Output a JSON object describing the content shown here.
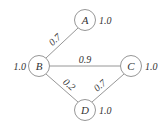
{
  "diagram": {
    "type": "weighted-graph",
    "nodes": [
      {
        "id": "A",
        "label": "A",
        "weight": "1.0",
        "cx": 85,
        "cy": 20
      },
      {
        "id": "B",
        "label": "B",
        "weight": "1.0",
        "cx": 39,
        "cy": 66
      },
      {
        "id": "C",
        "label": "C",
        "weight": "1.0",
        "cx": 131,
        "cy": 66
      },
      {
        "id": "D",
        "label": "D",
        "weight": "1.0",
        "cx": 85,
        "cy": 110
      }
    ],
    "edges": [
      {
        "from": "A",
        "to": "B",
        "label": "0.7"
      },
      {
        "from": "B",
        "to": "C",
        "label": "0.9"
      },
      {
        "from": "B",
        "to": "D",
        "label": "0.2"
      },
      {
        "from": "C",
        "to": "D",
        "label": "0.7"
      }
    ],
    "colors": {
      "stroke": "#8a8a8a",
      "text": "#333333",
      "background": "#ffffff"
    }
  }
}
